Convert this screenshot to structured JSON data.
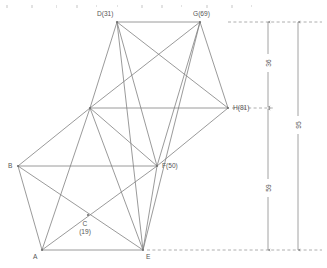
{
  "figure": {
    "type": "geometric-network-diagram",
    "background_color": "#ffffff",
    "line_color": "#808080",
    "text_color": "#555555",
    "dash_color": "#9a9a9a",
    "width": 327,
    "height": 268
  },
  "nodes": [
    {
      "id": "D",
      "label": "D(31)",
      "value": "31",
      "x": 117,
      "y": 22,
      "label_x": 97,
      "label_y": 16,
      "anchor": "start"
    },
    {
      "id": "G",
      "label": "G(69)",
      "value": "69",
      "x": 200,
      "y": 22,
      "label_x": 193,
      "label_y": 16,
      "anchor": "start"
    },
    {
      "id": "H",
      "label": "H(81)",
      "value": "81",
      "x": 228,
      "y": 108,
      "label_x": 233,
      "label_y": 110,
      "anchor": "start"
    },
    {
      "id": "B",
      "label": "B",
      "value": "",
      "x": 18,
      "y": 166,
      "label_x": 8,
      "label_y": 168,
      "anchor": "start"
    },
    {
      "id": "F",
      "label": "F(50)",
      "value": "50",
      "x": 157,
      "y": 166,
      "label_x": 162,
      "label_y": 168,
      "anchor": "start"
    },
    {
      "id": "A",
      "label": "A",
      "value": "",
      "x": 42,
      "y": 250,
      "label_x": 33,
      "label_y": 259,
      "anchor": "start"
    },
    {
      "id": "E",
      "label": "E",
      "value": "",
      "x": 143,
      "y": 250,
      "label_x": 146,
      "label_y": 259,
      "anchor": "start"
    },
    {
      "id": "C",
      "label": "C",
      "value": "19",
      "x": 88,
      "y": 215,
      "label_x": 85,
      "label_y": 226,
      "anchor": "middle"
    },
    {
      "id": "K",
      "label": "",
      "value": "",
      "x": 90,
      "y": 108,
      "label_x": 0,
      "label_y": 0,
      "anchor": "start"
    }
  ],
  "node_sub_labels": [
    {
      "id": "C-value",
      "text": "(19)",
      "x": 85,
      "y": 234,
      "anchor": "middle"
    }
  ],
  "edges": [
    {
      "from": "D",
      "to": "G"
    },
    {
      "from": "D",
      "to": "K"
    },
    {
      "from": "D",
      "to": "H"
    },
    {
      "from": "D",
      "to": "F"
    },
    {
      "from": "D",
      "to": "E"
    },
    {
      "from": "G",
      "to": "K"
    },
    {
      "from": "G",
      "to": "H"
    },
    {
      "from": "G",
      "to": "F"
    },
    {
      "from": "G",
      "to": "E"
    },
    {
      "from": "K",
      "to": "H"
    },
    {
      "from": "K",
      "to": "B"
    },
    {
      "from": "K",
      "to": "F"
    },
    {
      "from": "K",
      "to": "A"
    },
    {
      "from": "K",
      "to": "E"
    },
    {
      "from": "H",
      "to": "F"
    },
    {
      "from": "B",
      "to": "F"
    },
    {
      "from": "B",
      "to": "A"
    },
    {
      "from": "B",
      "to": "E"
    },
    {
      "from": "F",
      "to": "A"
    },
    {
      "from": "F",
      "to": "E"
    },
    {
      "from": "A",
      "to": "E"
    }
  ],
  "extension_lines": [
    {
      "id": "top-extension",
      "x1": 228,
      "y1": 22,
      "x2": 322,
      "y2": 22
    },
    {
      "id": "middle-extension",
      "x1": 232,
      "y1": 108,
      "x2": 274,
      "y2": 108
    },
    {
      "id": "bottom-extension",
      "x1": 147,
      "y1": 250,
      "x2": 322,
      "y2": 250
    }
  ],
  "dimensions": [
    {
      "id": "dim-36",
      "label": "36",
      "value": 36,
      "x": 268,
      "y1": 22,
      "y2": 107,
      "label_x": 268,
      "label_y": 63
    },
    {
      "id": "dim-59",
      "label": "59",
      "value": 59,
      "x": 268,
      "y1": 109,
      "y2": 250,
      "label_x": 268,
      "label_y": 188
    },
    {
      "id": "dim-95",
      "label": "95",
      "value": 95,
      "x": 298,
      "y1": 22,
      "y2": 250,
      "label_x": 298,
      "label_y": 125
    }
  ],
  "specks": [
    {
      "x": 6,
      "y": 5,
      "w": 2,
      "h": 3
    },
    {
      "x": 31,
      "y": 5,
      "w": 2,
      "h": 3
    },
    {
      "x": 56,
      "y": 5,
      "w": 1,
      "h": 3
    },
    {
      "x": 76,
      "y": 5,
      "w": 2,
      "h": 3
    },
    {
      "x": 96,
      "y": 5,
      "w": 1,
      "h": 2
    },
    {
      "x": 117,
      "y": 5,
      "w": 1,
      "h": 2
    },
    {
      "x": 141,
      "y": 5,
      "w": 2,
      "h": 3
    },
    {
      "x": 161,
      "y": 5,
      "w": 2,
      "h": 3
    },
    {
      "x": 181,
      "y": 5,
      "w": 1,
      "h": 2
    },
    {
      "x": 206,
      "y": 5,
      "w": 2,
      "h": 3
    },
    {
      "x": 231,
      "y": 5,
      "w": 2,
      "h": 3
    },
    {
      "x": 251,
      "y": 5,
      "w": 1,
      "h": 2
    }
  ]
}
